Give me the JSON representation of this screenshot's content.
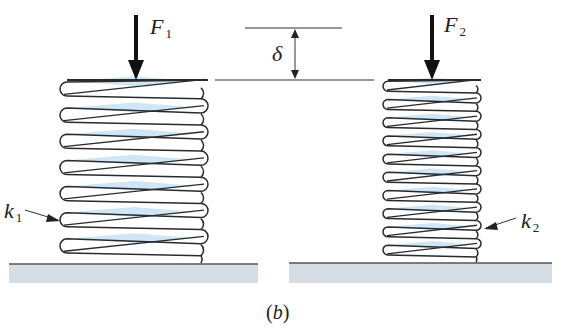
{
  "figure": {
    "caption_letter": "b",
    "caption_open": "(",
    "caption_close": ")",
    "colors": {
      "coil_stroke": "#2a2a2a",
      "coil_fill_highlight": "#cfe6f7",
      "ground_fill": "#d6dde3",
      "ground_line": "#555555",
      "arrow": "#111111",
      "background": "#ffffff"
    }
  },
  "forces": [
    {
      "symbol": "F",
      "subscript": "1",
      "direction": "down"
    },
    {
      "symbol": "F",
      "subscript": "2",
      "direction": "down"
    }
  ],
  "springs": [
    {
      "name": "left-spring",
      "stiffness_symbol": "k",
      "stiffness_subscript": "1",
      "coil_count": 7
    },
    {
      "name": "right-spring",
      "stiffness_symbol": "k",
      "stiffness_subscript": "2",
      "coil_count": 10
    }
  ],
  "deflection": {
    "symbol": "δ"
  }
}
